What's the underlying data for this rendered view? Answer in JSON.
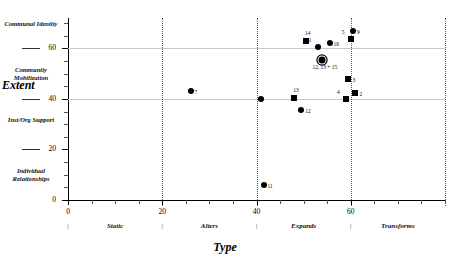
{
  "chart_data": {
    "type": "scatter",
    "title": "",
    "xlabel": "Type",
    "ylabel": "Extent",
    "xlim": [
      0,
      80
    ],
    "ylim": [
      0,
      72
    ],
    "grid": true,
    "legend": "none",
    "x_ticks": [
      0,
      20,
      40,
      60
    ],
    "x_tick_labels": [
      "0",
      "20",
      "40",
      "60"
    ],
    "x_minor_step": 5,
    "y_ticks": [
      0,
      20,
      40,
      60
    ],
    "y_tick_labels": [
      "0",
      "20",
      "40",
      "60"
    ],
    "y_minor_step": 5,
    "x_categories": [
      "Static",
      "Alters",
      "Expands",
      "Transforms"
    ],
    "x_category_centers": [
      10,
      30,
      50,
      70
    ],
    "x_category_separators": [
      0,
      20,
      40,
      60
    ],
    "y_categories": [
      "Individual Relationships",
      "Inst/Org Support",
      "Community Mobilization",
      "Communal Identity"
    ],
    "y_category_centers": [
      10,
      30,
      50,
      68
    ],
    "y_category_rules": [
      20,
      40,
      60
    ],
    "vertical_dotted_lines": [
      20,
      40,
      60,
      80
    ],
    "horizontal_gridlines": [
      40,
      60
    ],
    "points": [
      {
        "label": "7",
        "x": 26.0,
        "y": 43.0,
        "marker": "circle",
        "label_pos": "right"
      },
      {
        "label": "11",
        "x": 41.5,
        "y": 6.0,
        "marker": "circle",
        "label_pos": "right"
      },
      {
        "label": "",
        "x": 41.0,
        "y": 40.0,
        "marker": "circle",
        "label_pos": "right"
      },
      {
        "label": "13",
        "x": 48.0,
        "y": 40.5,
        "marker": "square",
        "label_pos": "above"
      },
      {
        "label": "12",
        "x": 49.5,
        "y": 35.5,
        "marker": "circle",
        "label_pos": "right"
      },
      {
        "label": "14",
        "x": 50.5,
        "y": 63.0,
        "marker": "square",
        "label_pos": "above"
      },
      {
        "label": "1",
        "x": 53.0,
        "y": 60.5,
        "marker": "circle",
        "label_pos": "upleft"
      },
      {
        "label": "16",
        "x": 55.5,
        "y": 62.0,
        "marker": "circle",
        "label_pos": "right"
      },
      {
        "label": "12, 13 + 15",
        "x": 54.0,
        "y": 55.5,
        "marker": "target",
        "label_pos": "below"
      },
      {
        "label": "5",
        "x": 60.0,
        "y": 63.5,
        "marker": "square",
        "label_pos": "upleft"
      },
      {
        "label": "9",
        "x": 60.5,
        "y": 67.0,
        "marker": "circle",
        "label_pos": "right"
      },
      {
        "label": "3",
        "x": 59.5,
        "y": 48.0,
        "marker": "square",
        "label_pos": "right"
      },
      {
        "label": "2",
        "x": 61.0,
        "y": 42.5,
        "marker": "square",
        "label_pos": "right"
      },
      {
        "label": "4",
        "x": 59.0,
        "y": 40.0,
        "marker": "square",
        "label_pos": "upleft"
      }
    ],
    "colors": {
      "marker": "#000000",
      "gridline": "#c9c9c9",
      "dotted_line": "#555555",
      "axis": "#000000",
      "background": "#ffffff"
    }
  }
}
